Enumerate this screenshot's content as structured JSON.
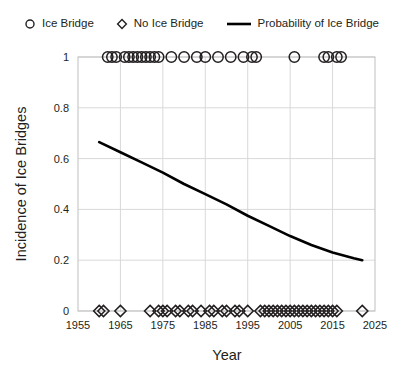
{
  "legend": {
    "items": [
      {
        "label": "Ice Bridge",
        "marker": "circle-marker-icon"
      },
      {
        "label": "No Ice Bridge",
        "marker": "diamond-marker-icon"
      },
      {
        "label": "Probability of Ice Bridge",
        "marker": "line-marker-icon"
      }
    ]
  },
  "chart_data": {
    "type": "scatter",
    "title": "",
    "xlabel": "Year",
    "ylabel": "Incidence of Ice Bridges",
    "xlim": [
      1955,
      2025
    ],
    "ylim": [
      0,
      1
    ],
    "xticks": [
      1955,
      1965,
      1975,
      1985,
      1995,
      2005,
      2015,
      2025
    ],
    "xtick_labels": [
      "1955",
      "1965",
      "1975",
      "1985",
      "1995",
      "2005",
      "2015",
      "2025"
    ],
    "yticks": [
      0,
      0.2,
      0.4,
      0.6,
      0.8,
      1
    ],
    "ytick_labels": [
      "0",
      "0.2",
      "0.4",
      "0.6",
      "0.8",
      "1"
    ],
    "grid": true,
    "legend_position": "top",
    "series": [
      {
        "name": "Ice Bridge",
        "marker": "circle",
        "y_value": 1,
        "x": [
          1962,
          1963,
          1964,
          1966,
          1967,
          1968,
          1969,
          1970,
          1971,
          1972,
          1973,
          1974,
          1977,
          1980,
          1983,
          1985,
          1988,
          1991,
          1994,
          1996,
          1997,
          2006,
          2013,
          2014,
          2016,
          2017
        ]
      },
      {
        "name": "No Ice Bridge",
        "marker": "diamond",
        "y_value": 0,
        "x": [
          1960,
          1961,
          1965,
          1972,
          1974,
          1975,
          1976,
          1978,
          1979,
          1981,
          1982,
          1984,
          1986,
          1987,
          1989,
          1990,
          1992,
          1993,
          1995,
          1998,
          1999,
          2000,
          2001,
          2002,
          2003,
          2004,
          2005,
          2006,
          2007,
          2008,
          2009,
          2010,
          2011,
          2012,
          2013,
          2014,
          2015,
          2016,
          2022
        ]
      },
      {
        "name": "Probability of Ice Bridge",
        "marker": "line",
        "x": [
          1960,
          1965,
          1970,
          1975,
          1980,
          1985,
          1990,
          1995,
          2000,
          2005,
          2010,
          2015,
          2020,
          2022
        ],
        "y": [
          0.665,
          0.625,
          0.585,
          0.545,
          0.5,
          0.46,
          0.42,
          0.375,
          0.335,
          0.295,
          0.26,
          0.23,
          0.208,
          0.2
        ]
      }
    ],
    "colors": {
      "marker_stroke": "#231f20",
      "line": "#000000",
      "grid": "#d9d9d9",
      "axis": "#bfbfbf",
      "text": "#231f20",
      "background": "#ffffff"
    }
  }
}
